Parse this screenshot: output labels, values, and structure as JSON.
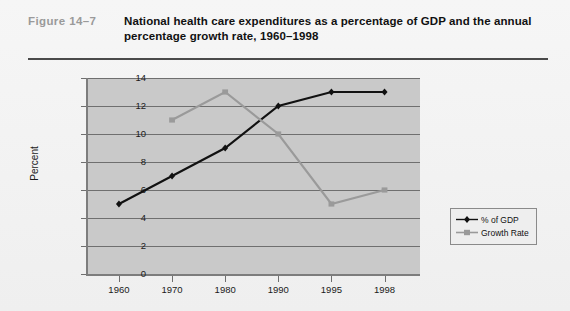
{
  "figure": {
    "label": "Figure 14–7",
    "title": "National health care expenditures as a percentage of GDP and the annual percentage growth rate, 1960–1998"
  },
  "colors": {
    "gdp_series": "#111111",
    "growth_series": "#9a9a9a",
    "plot_background": "#c9c9c9",
    "gridline": "#6f6f6f",
    "page_background": "#f2f2f2",
    "label_gray": "#9a9a9a"
  },
  "chart_data": {
    "type": "line",
    "title": "National health care expenditures as a percentage of GDP and the annual percentage growth rate, 1960–1998",
    "xlabel": "",
    "ylabel": "Percent",
    "categories": [
      "1960",
      "1970",
      "1980",
      "1990",
      "1995",
      "1998"
    ],
    "ylim": [
      0,
      14
    ],
    "yticks": [
      "0",
      "2",
      "4",
      "6",
      "8",
      "10",
      "12",
      "14"
    ],
    "grid": true,
    "legend_position": "right",
    "series": [
      {
        "name": "% of GDP",
        "color": "#111111",
        "marker": "diamond",
        "values": [
          5,
          7,
          9,
          12,
          13,
          13
        ]
      },
      {
        "name": "Growth Rate",
        "color": "#9a9a9a",
        "marker": "square",
        "values": [
          null,
          11,
          13,
          10,
          5,
          6
        ]
      }
    ]
  },
  "legend": {
    "items": [
      {
        "label": "% of GDP"
      },
      {
        "label": "Growth Rate"
      }
    ]
  }
}
